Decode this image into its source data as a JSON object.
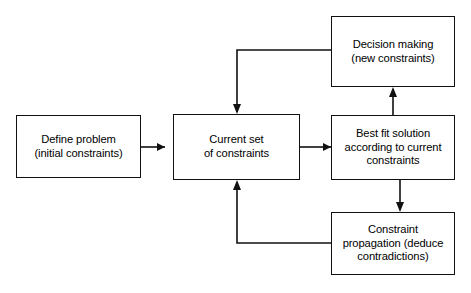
{
  "diagram": {
    "background_color": "#ffffff",
    "line_color": "#111111",
    "text_color": "#000000",
    "nodes": [
      {
        "id": "define",
        "name": "define-problem-node",
        "label": "Define problem\n(initial constraints)",
        "line1": "Define problem",
        "line2": "(initial constraints)"
      },
      {
        "id": "current",
        "name": "current-set-of-constraints-node",
        "label": "Current set\nof constraints",
        "line1": "Current set",
        "line2": "of constraints"
      },
      {
        "id": "decision",
        "name": "decision-making-node",
        "label": "Decision making\n(new constraints)",
        "line1": "Decision making",
        "line2": "(new constraints)"
      },
      {
        "id": "bestfit",
        "name": "best-fit-solution-node",
        "label": "Best fit solution\naccording to current\nconstraints",
        "line1": "Best fit solution",
        "line2": "according to current",
        "line3": "constraints"
      },
      {
        "id": "propagation",
        "name": "constraint-propagation-node",
        "label": "Constraint\npropagation (deduce\ncontradictions)",
        "line1": "Constraint",
        "line2": "propagation (deduce",
        "line3": "contradictions)"
      }
    ],
    "edges": [
      {
        "id": "e1",
        "from": "define",
        "to": "current",
        "label": ""
      },
      {
        "id": "e2",
        "from": "current",
        "to": "bestfit",
        "label": ""
      },
      {
        "id": "e3",
        "from": "bestfit",
        "to": "decision",
        "label": ""
      },
      {
        "id": "e4",
        "from": "decision",
        "to": "current",
        "label": ""
      },
      {
        "id": "e5",
        "from": "bestfit",
        "to": "propagation",
        "label": ""
      },
      {
        "id": "e6",
        "from": "propagation",
        "to": "current",
        "label": ""
      }
    ]
  }
}
